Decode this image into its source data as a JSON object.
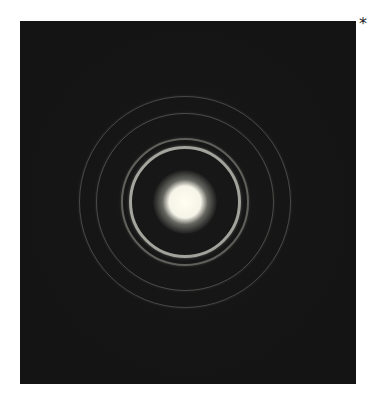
{
  "figure": {
    "marker": "*",
    "background_color": "#141414",
    "center": {
      "x": 165,
      "y": 181
    },
    "central_spot": {
      "radius": 16,
      "color": "#fffef0"
    },
    "rings": [
      {
        "radius": 56,
        "width": 3,
        "opacity": 0.9
      },
      {
        "radius": 64,
        "width": 2,
        "opacity": 0.45
      },
      {
        "radius": 89,
        "width": 1.5,
        "opacity": 0.3
      },
      {
        "radius": 106,
        "width": 1.5,
        "opacity": 0.28
      }
    ]
  }
}
